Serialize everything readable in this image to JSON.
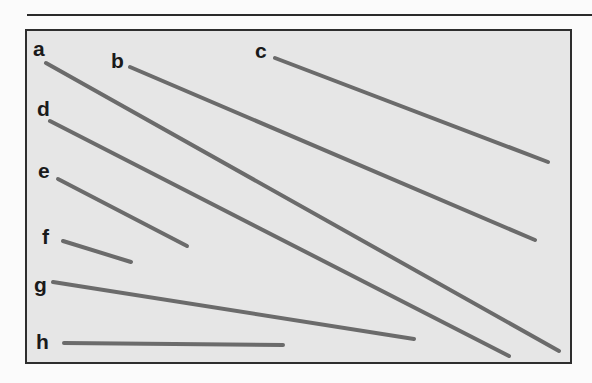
{
  "figure": {
    "background_color": "#e6e6e6",
    "border_color": "#2e2e2e",
    "line_color": "#6b6b6b",
    "lines": [
      {
        "label": "a",
        "label_x": 33,
        "label_y": 38,
        "x1": 46,
        "y1": 63,
        "x2": 559,
        "y2": 351
      },
      {
        "label": "b",
        "label_x": 111,
        "label_y": 50,
        "x1": 130,
        "y1": 67,
        "x2": 535,
        "y2": 240
      },
      {
        "label": "c",
        "label_x": 255,
        "label_y": 40,
        "x1": 275,
        "y1": 58,
        "x2": 548,
        "y2": 162
      },
      {
        "label": "d",
        "label_x": 37,
        "label_y": 98,
        "x1": 50,
        "y1": 121,
        "x2": 509,
        "y2": 356
      },
      {
        "label": "e",
        "label_x": 38,
        "label_y": 160,
        "x1": 58,
        "y1": 179,
        "x2": 187,
        "y2": 246
      },
      {
        "label": "f",
        "label_x": 42,
        "label_y": 226,
        "x1": 63,
        "y1": 241,
        "x2": 131,
        "y2": 262
      },
      {
        "label": "g",
        "label_x": 34,
        "label_y": 274,
        "x1": 53,
        "y1": 282,
        "x2": 414,
        "y2": 339
      },
      {
        "label": "h",
        "label_x": 36,
        "label_y": 331,
        "x1": 64,
        "y1": 343,
        "x2": 283,
        "y2": 345
      }
    ]
  }
}
